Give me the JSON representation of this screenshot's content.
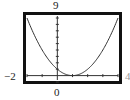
{
  "chart_data": {
    "type": "line",
    "title": "",
    "xlabel": "",
    "ylabel": "",
    "function": "y = (x - 1)^2",
    "xlim": [
      -2,
      4
    ],
    "ylim": [
      -1,
      9
    ],
    "xscale": 1,
    "yscale": 1,
    "grid": false,
    "legend": null,
    "series": [
      {
        "name": "y = (x - 1)^2",
        "x": [
          -2,
          -1.5,
          -1,
          -0.5,
          0,
          0.5,
          1,
          1.5,
          2,
          2.5,
          3,
          3.5,
          4
        ],
        "y": [
          9,
          6.25,
          4,
          2.25,
          1,
          0.25,
          0,
          0.25,
          1,
          2.25,
          4,
          6.25,
          9
        ]
      }
    ],
    "tick_labels": {
      "ymax": "9",
      "xmin": "-2",
      "xmax": "4",
      "origin_x": "0"
    }
  },
  "labels": {
    "top": "9",
    "left": "−2",
    "right": "4",
    "bottom": "0"
  }
}
